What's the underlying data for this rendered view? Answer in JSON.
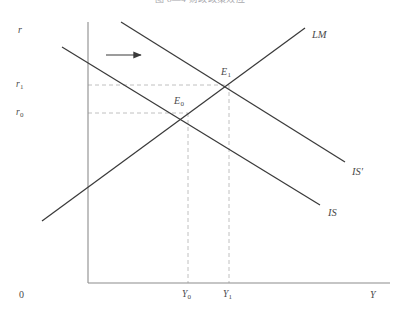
{
  "figure": {
    "caption": "图 8—4   财政政策效应",
    "type": "is-lm-diagram"
  },
  "colors": {
    "axis": "#8c8c8c",
    "curve": "#3a3a3a",
    "dashed": "#b9b9b9",
    "text": "#4a4a4a",
    "caption": "#a9a9ad",
    "background": "#ffffff"
  },
  "axes": {
    "y_axis_label": "r",
    "x_axis_label": "Y",
    "origin_label": "0",
    "y_axis": {
      "x": 88,
      "y_top": 22,
      "y_bottom": 283
    },
    "x_axis": {
      "y": 283,
      "x_left": 88,
      "x_right": 390
    }
  },
  "ticks": {
    "y": [
      {
        "name": "r1",
        "base": "r",
        "sub": "1",
        "value_y": 85
      },
      {
        "name": "r0",
        "base": "r",
        "sub": "0",
        "value_y": 113
      }
    ],
    "x": [
      {
        "name": "Y0",
        "base": "Y",
        "sub": "0",
        "value_x": 188
      },
      {
        "name": "Y1",
        "base": "Y",
        "sub": "1",
        "value_x": 229
      }
    ]
  },
  "curves": [
    {
      "id": "is",
      "label": "IS",
      "label_x": 328,
      "label_y": 213,
      "x1": 62,
      "y1": 47,
      "x2": 320,
      "y2": 205,
      "slope": "downward"
    },
    {
      "id": "is-prime",
      "label": "IS",
      "label_suffix": "′",
      "label_x": 352,
      "label_y": 172,
      "x1": 121,
      "y1": 22,
      "x2": 345,
      "y2": 162,
      "slope": "downward"
    },
    {
      "id": "lm",
      "label": "LM",
      "label_x": 312,
      "label_y": 35,
      "x1": 42,
      "y1": 221,
      "x2": 305,
      "y2": 28,
      "slope": "upward"
    }
  ],
  "equilibria": [
    {
      "id": "E0",
      "base": "E",
      "sub": "0",
      "x": 188,
      "y": 113,
      "label_x": 175,
      "label_y": 101,
      "rate": "r0",
      "output": "Y0"
    },
    {
      "id": "E1",
      "base": "E",
      "sub": "1",
      "x": 229,
      "y": 85,
      "label_x": 222,
      "label_y": 72,
      "rate": "r1",
      "output": "Y1"
    }
  ],
  "annotations": [
    {
      "id": "shift-arrow",
      "name": "rightward-shift-arrow",
      "x1": 106,
      "y1": 55,
      "x2": 142,
      "y2": 55,
      "direction": "right",
      "meaning": "IS curve shifts right"
    }
  ],
  "guides": [
    {
      "id": "h-r1",
      "from_x": 88,
      "to_x": 229,
      "y": 85,
      "orientation": "horizontal"
    },
    {
      "id": "h-r0",
      "from_x": 88,
      "to_x": 188,
      "y": 113,
      "orientation": "horizontal"
    },
    {
      "id": "v-Y0",
      "x": 188,
      "from_y": 113,
      "to_y": 283,
      "orientation": "vertical"
    },
    {
      "id": "v-Y1",
      "x": 229,
      "from_y": 85,
      "to_y": 283,
      "orientation": "vertical"
    }
  ]
}
